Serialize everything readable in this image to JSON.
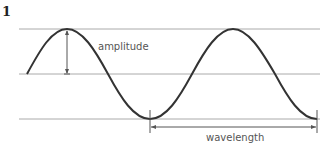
{
  "figure": {
    "number": "1",
    "labels": {
      "amplitude": "amplitude",
      "wavelength": "wavelength"
    },
    "colors": {
      "wave": "#333333",
      "guide_lines": "#aaaaaa",
      "arrows": "#555555"
    }
  }
}
